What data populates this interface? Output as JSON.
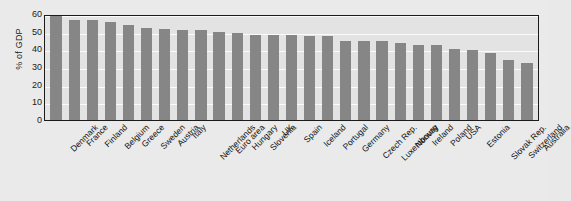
{
  "chart": {
    "type": "bar",
    "ylabel": "% of GDP",
    "yticks": [
      "0",
      "10",
      "20",
      "30",
      "40",
      "50",
      "60"
    ]
  },
  "chart_data": {
    "type": "bar",
    "title": "",
    "xlabel": "",
    "ylabel": "% of GDP",
    "ylim": [
      0,
      60
    ],
    "grid": true,
    "legend": "none",
    "bar_color": "#868686",
    "categories": [
      "Denmark",
      "France",
      "Finland",
      "Belgium",
      "Greece",
      "Sweden",
      "Austria",
      "Italy",
      "Netherlands",
      "Euro area",
      "Hungary",
      "Slovenia",
      "UK",
      "Spain",
      "Iceland",
      "Portugal",
      "Germany",
      "Czech Rep.",
      "Luxembourg",
      "Norway",
      "Ireland",
      "Poland",
      "USA",
      "Estonia",
      "Slovak Rep.",
      "Switzerland",
      "Australia"
    ],
    "values": [
      59.5,
      56.8,
      56.5,
      55.2,
      53.7,
      52.1,
      51.7,
      50.8,
      50.7,
      50.0,
      49.1,
      48.2,
      47.9,
      47.9,
      47.8,
      47.8,
      45.0,
      44.5,
      44.6,
      43.4,
      42.6,
      42.4,
      40.4,
      39.6,
      38.0,
      34.2,
      32.4
    ],
    "yticks": [
      0,
      10,
      20,
      30,
      40,
      50,
      60
    ]
  }
}
